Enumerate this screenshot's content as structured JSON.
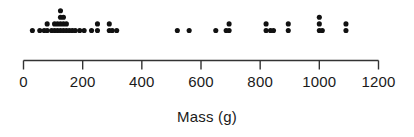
{
  "chart_data": {
    "type": "scatter",
    "plot_style": "dotplot",
    "title": "",
    "subtitle": "",
    "xlabel": "Mass (g)",
    "ylabel": "",
    "xlim": [
      0,
      1200
    ],
    "xticks": [
      0,
      200,
      400,
      600,
      800,
      1000,
      1200
    ],
    "xtick_labels": [
      "0",
      "200",
      "400",
      "600",
      "800",
      "1000",
      "1200"
    ],
    "grid": false,
    "legend": null,
    "units": "g",
    "dot_color": "#111111",
    "axis_color": "#333333",
    "n_observations": 53,
    "columns": [
      {
        "x": 30,
        "count": 1
      },
      {
        "x": 55,
        "count": 1
      },
      {
        "x": 70,
        "count": 1
      },
      {
        "x": 80,
        "count": 2
      },
      {
        "x": 95,
        "count": 1
      },
      {
        "x": 105,
        "count": 2
      },
      {
        "x": 115,
        "count": 2
      },
      {
        "x": 125,
        "count": 4
      },
      {
        "x": 135,
        "count": 3
      },
      {
        "x": 145,
        "count": 2
      },
      {
        "x": 155,
        "count": 1
      },
      {
        "x": 165,
        "count": 1
      },
      {
        "x": 175,
        "count": 1
      },
      {
        "x": 190,
        "count": 1
      },
      {
        "x": 205,
        "count": 1
      },
      {
        "x": 230,
        "count": 1
      },
      {
        "x": 250,
        "count": 2
      },
      {
        "x": 290,
        "count": 2
      },
      {
        "x": 300,
        "count": 1
      },
      {
        "x": 315,
        "count": 1
      },
      {
        "x": 520,
        "count": 1
      },
      {
        "x": 560,
        "count": 1
      },
      {
        "x": 650,
        "count": 1
      },
      {
        "x": 685,
        "count": 1
      },
      {
        "x": 695,
        "count": 2
      },
      {
        "x": 820,
        "count": 2
      },
      {
        "x": 835,
        "count": 1
      },
      {
        "x": 845,
        "count": 1
      },
      {
        "x": 895,
        "count": 2
      },
      {
        "x": 1000,
        "count": 3
      },
      {
        "x": 1010,
        "count": 1
      },
      {
        "x": 1090,
        "count": 2
      }
    ],
    "values": [
      30,
      55,
      70,
      80,
      80,
      95,
      105,
      105,
      115,
      115,
      125,
      125,
      125,
      125,
      135,
      135,
      135,
      145,
      145,
      155,
      165,
      175,
      190,
      205,
      230,
      250,
      250,
      290,
      290,
      300,
      315,
      520,
      560,
      650,
      685,
      695,
      695,
      820,
      820,
      835,
      845,
      895,
      895,
      1000,
      1000,
      1000,
      1010,
      1090,
      1090
    ]
  },
  "axis": {
    "title": "Mass (g)",
    "tick_labels": [
      "0",
      "200",
      "400",
      "600",
      "800",
      "1000",
      "1200"
    ]
  }
}
